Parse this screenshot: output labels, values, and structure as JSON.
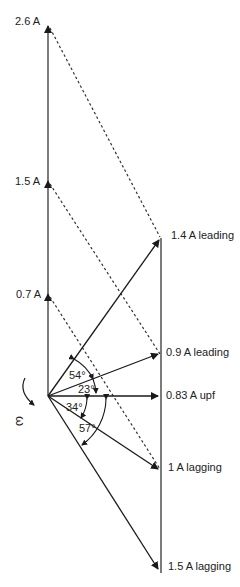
{
  "diagram": {
    "type": "phasor-diagram",
    "rotation_symbol": "ω",
    "axis_labels": [
      {
        "id": "a26",
        "text": "2.6 A"
      },
      {
        "id": "a15",
        "text": "1.5 A"
      },
      {
        "id": "a07",
        "text": "0.7 A"
      }
    ],
    "phasor_labels": [
      {
        "id": "p14",
        "text": "1.4 A leading"
      },
      {
        "id": "p09",
        "text": "0.9 A leading"
      },
      {
        "id": "p083",
        "text": "0.83 A upf"
      },
      {
        "id": "p1",
        "text": "1 A lagging"
      },
      {
        "id": "p15",
        "text": "1.5 A lagging"
      }
    ],
    "angles": [
      {
        "id": "ang54",
        "text": "54°"
      },
      {
        "id": "ang23",
        "text": "23°"
      },
      {
        "id": "ang34",
        "text": "34°"
      },
      {
        "id": "ang57",
        "text": "57°"
      }
    ],
    "colors": {
      "line": "#1a1a1a",
      "text": "#222222"
    }
  }
}
